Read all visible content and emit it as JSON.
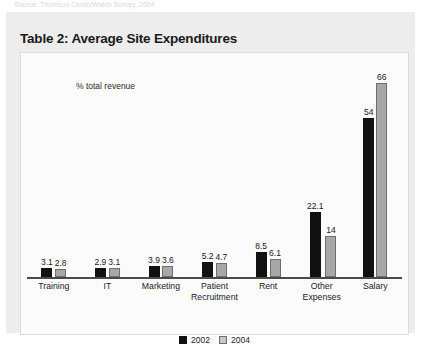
{
  "source_note": "Source: Thomson CenterWatch Survey, 2004",
  "title": "Table 2: Average Site Expenditures",
  "legend": {
    "items": [
      {
        "label": "2002",
        "color": "#111111"
      },
      {
        "label": "2004",
        "color": "#c9c9c9"
      }
    ]
  },
  "chart_data": {
    "type": "bar",
    "title": "Table 2: Average Site Expenditures",
    "annotation": "% total revenue",
    "xlabel": "",
    "ylabel": "% total revenue",
    "ylim": [
      0,
      72
    ],
    "grid": false,
    "legend_position": "bottom",
    "categories": [
      "Training",
      "IT",
      "Marketing",
      "Patient Recruitment",
      "Rent",
      "Other Expenses",
      "Salary"
    ],
    "category_lines": [
      [
        "Training"
      ],
      [
        "IT"
      ],
      [
        "Marketing"
      ],
      [
        "Patient",
        "Recruitment"
      ],
      [
        "Rent"
      ],
      [
        "Other",
        "Expenses"
      ],
      [
        "Salary"
      ]
    ],
    "series": [
      {
        "name": "2002",
        "color": "#111111",
        "values": [
          3.1,
          2.9,
          3.9,
          5.2,
          8.5,
          22.1,
          54
        ],
        "labels": [
          "3.1",
          "2.9",
          "3.9",
          "5.2",
          "8.5",
          "22.1",
          "54"
        ]
      },
      {
        "name": "2004",
        "color": "#a8a8a8",
        "values": [
          2.8,
          3.1,
          3.6,
          4.7,
          6.1,
          14,
          66
        ],
        "labels": [
          "2.8",
          "3.1",
          "3.6",
          "4.7",
          "6.1",
          "14",
          "66"
        ]
      }
    ]
  }
}
